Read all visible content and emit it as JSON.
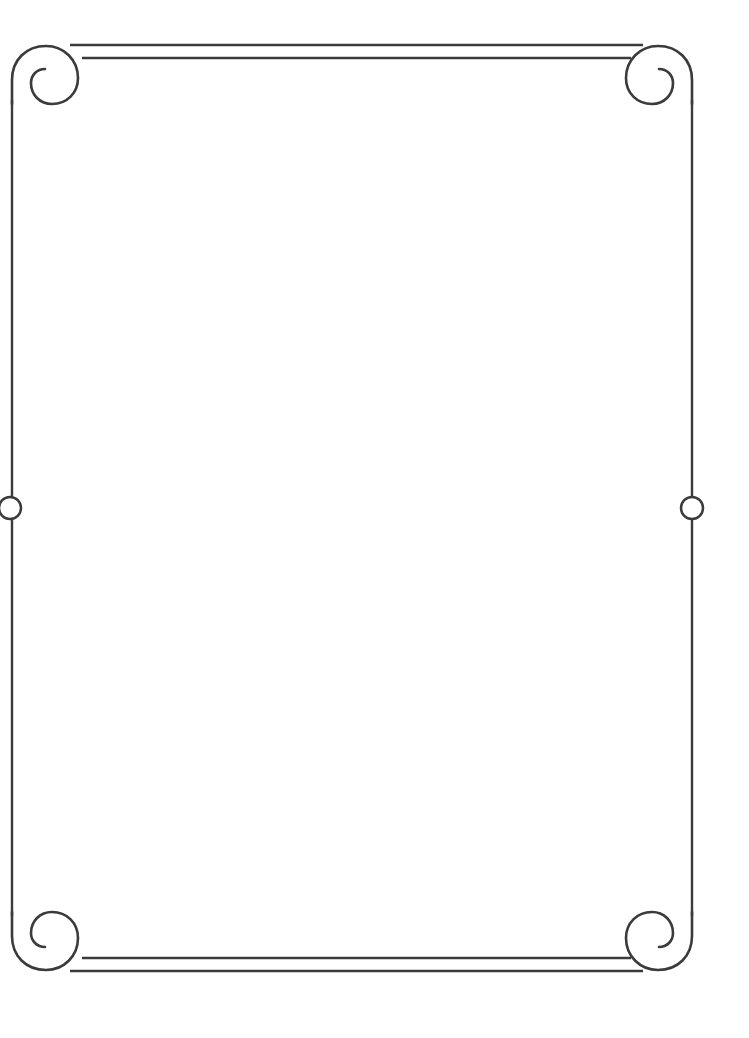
{
  "document": {
    "type": "ornamental-border-frame",
    "orientation": "portrait",
    "page_width": 749,
    "page_height": 1038,
    "background_color": "#ffffff",
    "ink_color": "#3b3b3b",
    "body_text": ""
  },
  "frame": {
    "style_name": "scrollwork-corner-border",
    "stroke_color": "#3b3b3b",
    "stroke_width": 2.5,
    "left_rail_x": 12,
    "right_rail_x": 692,
    "top_rule_y": 45,
    "bottom_rule_y": 971,
    "corner_ornament_count": 4,
    "side_accent_count": 2
  },
  "corners": [
    {
      "name": "top-left-spiral",
      "position": "top-left",
      "center_x": 41,
      "center_y": 75,
      "outer_radius": 29,
      "rotation_deg": 0
    },
    {
      "name": "top-right-spiral",
      "position": "top-right",
      "center_x": 663,
      "center_y": 75,
      "outer_radius": 29,
      "rotation_deg": 90
    },
    {
      "name": "bottom-right-spiral",
      "position": "bottom-right",
      "center_x": 663,
      "center_y": 941,
      "outer_radius": 29,
      "rotation_deg": 180
    },
    {
      "name": "bottom-left-spiral",
      "position": "bottom-left",
      "center_x": 41,
      "center_y": 941,
      "outer_radius": 29,
      "rotation_deg": 270
    }
  ],
  "rules": [
    {
      "name": "top-outer-rule",
      "edge": "top",
      "y": 45,
      "x_start": 70,
      "x_end": 643
    },
    {
      "name": "top-inner-rule",
      "edge": "top",
      "y": 58,
      "x_start": 82,
      "x_end": 631
    },
    {
      "name": "bottom-inner-rule",
      "edge": "bottom",
      "y": 958,
      "x_start": 82,
      "x_end": 631
    },
    {
      "name": "bottom-outer-rule",
      "edge": "bottom",
      "y": 971,
      "x_start": 70,
      "x_end": 643
    }
  ],
  "side_accents": [
    {
      "name": "left-circle-accent",
      "side": "left",
      "center_x": 10,
      "center_y": 508,
      "radius": 11
    },
    {
      "name": "right-circle-accent",
      "side": "right",
      "center_x": 692,
      "center_y": 508,
      "radius": 11
    }
  ],
  "rails": [
    {
      "name": "left-rail-upper",
      "x": 12,
      "y_start": 100,
      "y_end": 497
    },
    {
      "name": "left-rail-lower",
      "x": 12,
      "y_start": 519,
      "y_end": 916
    },
    {
      "name": "right-rail-upper",
      "x": 692,
      "y_start": 100,
      "y_end": 497
    },
    {
      "name": "right-rail-lower",
      "x": 692,
      "y_start": 519,
      "y_end": 916
    }
  ]
}
